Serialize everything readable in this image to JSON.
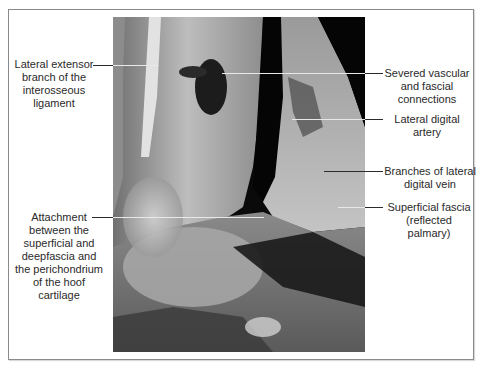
{
  "figure": {
    "type": "anatomical-photo",
    "labels": [
      {
        "id": "lateral-extensor-branch",
        "text": "Lateral extensor\nbranch of the\ninterosseous\nligament",
        "side": "left"
      },
      {
        "id": "severed-vascular",
        "text": "Severed vascular\nand fascial\nconnections",
        "side": "right"
      },
      {
        "id": "lateral-digital-artery",
        "text": "Lateral digital\nartery",
        "side": "right"
      },
      {
        "id": "branches-lateral-digital-vein",
        "text": "Branches of lateral\ndigital vein",
        "side": "right"
      },
      {
        "id": "superficial-fascia",
        "text": "Superficial fascia\n(reflected\npalmary)",
        "side": "right"
      },
      {
        "id": "attachment",
        "text": "Attachment\nbetween the\nsuperficial and\ndeepfascia and\nthe perichondrium\nof the hoof\ncartilage",
        "side": "left"
      }
    ]
  },
  "colors": {
    "text": "#2a2a2a",
    "frame": "#8a8a8a",
    "leader_on_white": "#2b2b2b",
    "leader_on_photo": "#e8e8e8",
    "photo_background": "#0a0a0a"
  }
}
